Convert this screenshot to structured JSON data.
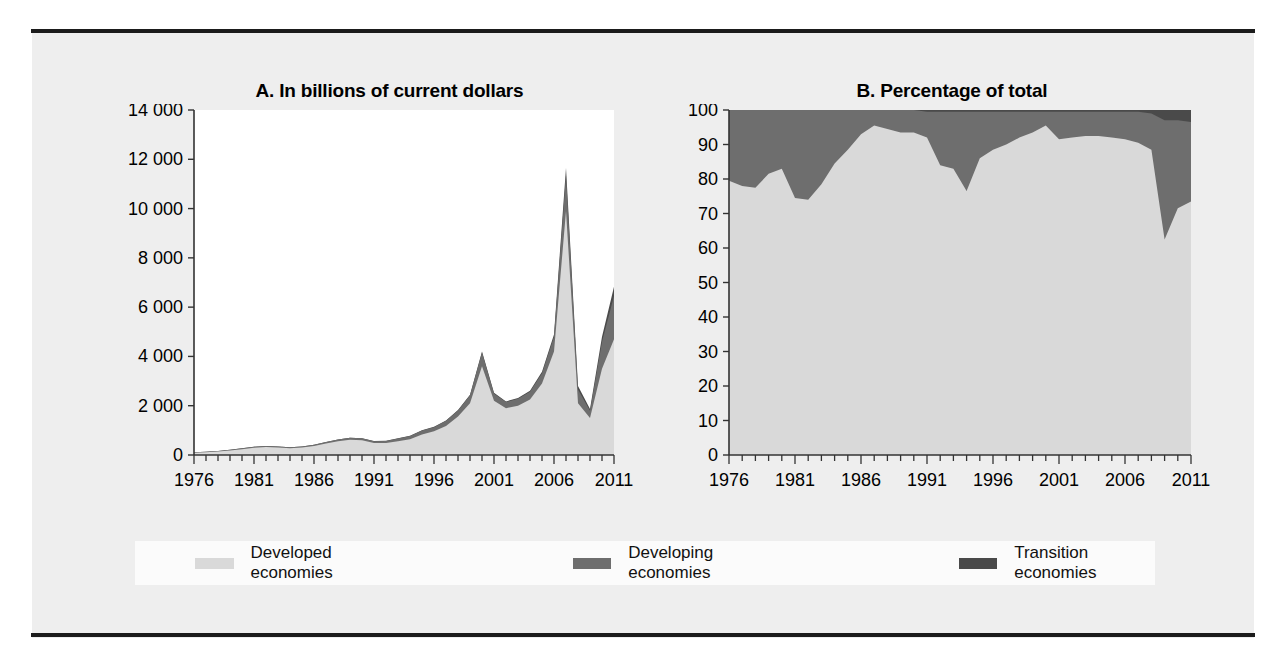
{
  "figure": {
    "background": "#eeeeee",
    "rule_color": "#1b1b1b"
  },
  "legend": {
    "items": [
      {
        "label": "Developed economies",
        "color": "#d9d9d9"
      },
      {
        "label": "Developing economies",
        "color": "#6e6e6e"
      },
      {
        "label": "Transition economies",
        "color": "#4a4a4a"
      }
    ]
  },
  "chart_data": [
    {
      "id": "A",
      "type": "area",
      "stacked": true,
      "title": "A. In billions of current dollars",
      "xlabel": "",
      "ylabel": "",
      "grid": false,
      "legend_position": "bottom",
      "xlim": [
        1976,
        2011
      ],
      "ylim": [
        0,
        14000
      ],
      "yticks": [
        0,
        2000,
        4000,
        6000,
        8000,
        10000,
        12000,
        14000
      ],
      "ytick_labels": [
        "0",
        "2 000",
        "4 000",
        "6 000",
        "8 000",
        "10 000",
        "12 000",
        "14 000"
      ],
      "xticks": [
        1976,
        1981,
        1986,
        1991,
        1996,
        2001,
        2006,
        2011
      ],
      "xtick_labels": [
        "1976",
        "1981",
        "1986",
        "1991",
        "1996",
        "2001",
        "2006",
        "2011"
      ],
      "x": [
        1976,
        1977,
        1978,
        1979,
        1980,
        1981,
        1982,
        1983,
        1984,
        1985,
        1986,
        1987,
        1988,
        1989,
        1990,
        1991,
        1992,
        1993,
        1994,
        1995,
        1996,
        1997,
        1998,
        1999,
        2000,
        2001,
        2002,
        2003,
        2004,
        2005,
        2006,
        2007,
        2008,
        2009,
        2010,
        2011
      ],
      "series": [
        {
          "name": "Developed economies",
          "color": "#d9d9d9",
          "values": [
            90,
            110,
            140,
            180,
            230,
            290,
            320,
            300,
            270,
            300,
            370,
            470,
            560,
            620,
            600,
            490,
            490,
            560,
            640,
            830,
            960,
            1180,
            1560,
            2100,
            3600,
            2200,
            1900,
            2000,
            2250,
            2900,
            4200,
            9900,
            2100,
            1500,
            3500,
            4700
          ],
          "stack_order": 0
        },
        {
          "name": "Developing economies",
          "color": "#6e6e6e",
          "values": [
            20,
            20,
            25,
            30,
            40,
            45,
            50,
            45,
            40,
            45,
            50,
            60,
            70,
            80,
            75,
            70,
            80,
            110,
            130,
            160,
            170,
            210,
            250,
            320,
            560,
            300,
            250,
            280,
            320,
            420,
            600,
            1450,
            560,
            300,
            1100,
            1750
          ],
          "stack_order": 1
        },
        {
          "name": "Transition economies",
          "color": "#4a4a4a",
          "values": [
            0,
            0,
            0,
            0,
            0,
            0,
            0,
            0,
            0,
            0,
            0,
            0,
            0,
            0,
            0,
            5,
            5,
            5,
            8,
            10,
            12,
            15,
            18,
            25,
            40,
            30,
            25,
            30,
            40,
            60,
            90,
            300,
            140,
            70,
            200,
            380
          ],
          "stack_order": 2
        }
      ]
    },
    {
      "id": "B",
      "type": "area",
      "stacked": true,
      "title": "B. Percentage of total",
      "xlabel": "",
      "ylabel": "",
      "grid": false,
      "legend_position": "bottom",
      "xlim": [
        1976,
        2011
      ],
      "ylim": [
        0,
        100
      ],
      "yticks": [
        0,
        10,
        20,
        30,
        40,
        50,
        60,
        70,
        80,
        90,
        100
      ],
      "ytick_labels": [
        "0",
        "10",
        "20",
        "30",
        "40",
        "50",
        "60",
        "70",
        "80",
        "90",
        "100"
      ],
      "xticks": [
        1976,
        1981,
        1986,
        1991,
        1996,
        2001,
        2006,
        2011
      ],
      "xtick_labels": [
        "1976",
        "1981",
        "1986",
        "1991",
        "1996",
        "2001",
        "2006",
        "2011"
      ],
      "x": [
        1976,
        1977,
        1978,
        1979,
        1980,
        1981,
        1982,
        1983,
        1984,
        1985,
        1986,
        1987,
        1988,
        1989,
        1990,
        1991,
        1992,
        1993,
        1994,
        1995,
        1996,
        1997,
        1998,
        1999,
        2000,
        2001,
        2002,
        2003,
        2004,
        2005,
        2006,
        2007,
        2008,
        2009,
        2010,
        2011
      ],
      "series": [
        {
          "name": "Developed economies",
          "color": "#d9d9d9",
          "values": [
            79.5,
            78.0,
            77.5,
            81.5,
            83.0,
            74.5,
            74.0,
            78.5,
            84.5,
            88.5,
            93.0,
            95.5,
            94.5,
            93.5,
            93.5,
            92.0,
            84.0,
            83.0,
            76.5,
            86.0,
            88.5,
            90.0,
            92.0,
            93.5,
            95.5,
            91.5,
            92.0,
            92.5,
            92.5,
            92.0,
            91.5,
            90.5,
            88.5,
            62.5,
            71.5,
            73.5
          ],
          "stack_order": 0
        },
        {
          "name": "Developing economies",
          "color": "#6e6e6e",
          "values": [
            20.5,
            22.0,
            22.5,
            18.5,
            17.0,
            25.5,
            26.0,
            21.5,
            15.5,
            11.5,
            7.0,
            4.5,
            5.5,
            6.5,
            6.5,
            7.5,
            15.5,
            16.5,
            23.0,
            13.5,
            11.0,
            9.5,
            7.5,
            6.0,
            4.0,
            8.0,
            7.5,
            7.0,
            7.0,
            7.5,
            8.0,
            9.0,
            10.5,
            34.5,
            25.5,
            23.0
          ],
          "stack_order": 1
        },
        {
          "name": "Transition economies",
          "color": "#4a4a4a",
          "values": [
            0,
            0,
            0,
            0,
            0,
            0,
            0,
            0,
            0,
            0,
            0,
            0,
            0,
            0,
            0,
            0.5,
            0.5,
            0.5,
            0.5,
            0.5,
            0.5,
            0.5,
            0.5,
            0.5,
            0.5,
            0.5,
            0.5,
            0.5,
            0.5,
            0.5,
            0.5,
            0.5,
            1.0,
            3.0,
            3.0,
            3.5
          ],
          "stack_order": 2
        }
      ]
    }
  ]
}
